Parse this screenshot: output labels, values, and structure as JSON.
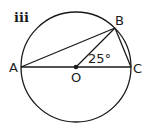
{
  "diagram": {
    "part_label": "iii",
    "circle": {
      "center": "O",
      "cx": 76,
      "cy": 67,
      "r": 55
    },
    "points": {
      "A": {
        "label": "A",
        "x": 21,
        "y": 67
      },
      "B": {
        "label": "B",
        "x": 115,
        "y": 28
      },
      "C": {
        "label": "C",
        "x": 131,
        "y": 67
      },
      "O": {
        "label": "O",
        "x": 76,
        "y": 67
      }
    },
    "segments": [
      "AC",
      "AB",
      "OB",
      "BC"
    ],
    "angle": {
      "vertex": "O",
      "between": "OB-OC",
      "label": "25°"
    },
    "colors": {
      "stroke": "#1a1a1a",
      "background": "#ffffff"
    }
  }
}
